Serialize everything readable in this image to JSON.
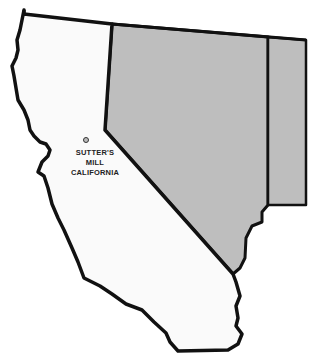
{
  "map": {
    "title": "Sutter's Mill location map",
    "colors": {
      "background": "#ffffff",
      "california_fill": "#fafafa",
      "neighbor_fill": "#bebebe",
      "border": "#111111"
    },
    "regions": [
      {
        "name": "California",
        "fill": "white"
      },
      {
        "name": "Nevada",
        "fill": "gray"
      },
      {
        "name": "Utah (partial)",
        "fill": "gray"
      }
    ],
    "marker": {
      "icon": "location-circle-icon",
      "label_line1": "SUTTER'S",
      "label_line2": "MILL",
      "label_line3": "CALIFORNIA"
    }
  }
}
